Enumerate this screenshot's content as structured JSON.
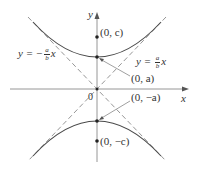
{
  "diagram": {
    "axes": {
      "x_label": "x",
      "y_label": "y",
      "origin_label": "0"
    },
    "points": {
      "focus_top": "(0, c)",
      "vertex_top": "(0, a)",
      "vertex_bottom": "(0, −a)",
      "focus_bottom": "(0, −c)"
    },
    "asymptotes": {
      "left": {
        "prefix": "y = −",
        "num": "a",
        "den": "b",
        "var": "x"
      },
      "right": {
        "prefix": "y = ",
        "num": "a",
        "den": "b",
        "var": "x"
      }
    },
    "colors": {
      "curve": "#4a4a4a",
      "axis": "#8a8a8a",
      "asymptote": "#8a8a8a",
      "text": "#333333"
    }
  }
}
